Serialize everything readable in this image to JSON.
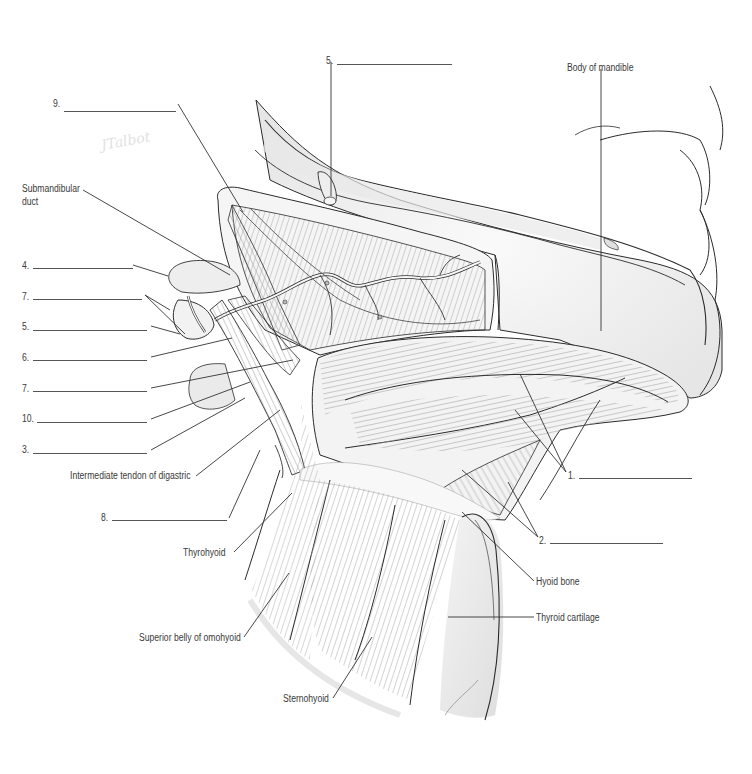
{
  "diagram": {
    "signature": "JTalbot",
    "colors": {
      "outline": "#2b2b2b",
      "fiber": "#8a8a8a",
      "shade": "#e4e4e4",
      "shade_light": "#f1f1f1",
      "leader": "#333333",
      "text": "#3a3a3a"
    },
    "numbered_labels": [
      {
        "id": "label-9",
        "number": "9.",
        "x": 53,
        "y": 104,
        "line_x1": 64,
        "line_x2": 176
      },
      {
        "id": "label-5-top",
        "number": "5.",
        "x": 326,
        "y": 56,
        "line_x1": 337,
        "line_x2": 452
      },
      {
        "id": "label-4",
        "number": "4.",
        "x": 22,
        "y": 261,
        "line_x1": 33,
        "line_x2": 133
      },
      {
        "id": "label-7-a",
        "number": "7.",
        "x": 22,
        "y": 292,
        "line_x1": 33,
        "line_x2": 142
      },
      {
        "id": "label-5",
        "number": "5.",
        "x": 22,
        "y": 322,
        "line_x1": 33,
        "line_x2": 147
      },
      {
        "id": "label-6",
        "number": "6.",
        "x": 22,
        "y": 353,
        "line_x1": 33,
        "line_x2": 147
      },
      {
        "id": "label-7-b",
        "number": "7.",
        "x": 22,
        "y": 384,
        "line_x1": 33,
        "line_x2": 147
      },
      {
        "id": "label-10",
        "number": "10.",
        "x": 22,
        "y": 415,
        "line_x1": 37,
        "line_x2": 147
      },
      {
        "id": "label-3",
        "number": "3.",
        "x": 22,
        "y": 446,
        "line_x1": 33,
        "line_x2": 147
      },
      {
        "id": "label-8",
        "number": "8.",
        "x": 101,
        "y": 514,
        "line_x1": 112,
        "line_x2": 227
      },
      {
        "id": "label-1",
        "number": "1.",
        "x": 568,
        "y": 471,
        "line_x1": 579,
        "line_x2": 692
      },
      {
        "id": "label-2",
        "number": "2.",
        "x": 539,
        "y": 536,
        "line_x1": 550,
        "line_x2": 663
      }
    ],
    "named_labels": [
      {
        "id": "submandibular-duct",
        "text": "Submandibular",
        "x": 22,
        "y": 184
      },
      {
        "id": "submandibular-duct-2",
        "text": "duct",
        "x": 22,
        "y": 197
      },
      {
        "id": "body-of-mandible",
        "text": "Body of mandible",
        "x": 567,
        "y": 63
      },
      {
        "id": "intermediate-tendon",
        "text": "Intermediate tendon of digastric",
        "x": 70,
        "y": 471
      },
      {
        "id": "thyrohyoid",
        "text": "Thyrohyoid",
        "x": 183,
        "y": 548
      },
      {
        "id": "hyoid-bone",
        "text": "Hyoid bone",
        "x": 536,
        "y": 577
      },
      {
        "id": "thyroid-cartilage",
        "text": "Thyroid cartilage",
        "x": 536,
        "y": 613
      },
      {
        "id": "superior-belly-omohyoid",
        "text": "Superior belly of omohyoid",
        "x": 139,
        "y": 633
      },
      {
        "id": "sternohyoid",
        "text": "Sternohyoid",
        "x": 283,
        "y": 694
      }
    ]
  }
}
